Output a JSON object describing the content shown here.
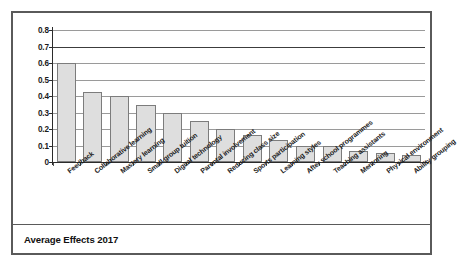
{
  "caption": "Average Effects 2017",
  "chart_data": {
    "type": "bar",
    "title": "Average Effects 2017",
    "xlabel": "",
    "ylabel": "",
    "ylim": [
      0,
      0.8
    ],
    "grid": true,
    "legend": "none",
    "orientation": "vertical",
    "bar_fill": "#dedede",
    "bar_border": "#7c7c7c",
    "yticks": [
      "0",
      "0.1",
      "0.2",
      "0.3",
      "0.4",
      "0.5",
      "0.6",
      "0.7",
      "0.8"
    ],
    "ytick_values": [
      0,
      0.1,
      0.2,
      0.3,
      0.4,
      0.5,
      0.6,
      0.7,
      0.8
    ],
    "categories": [
      "Feedback",
      "Collaborative learning",
      "Mastery learning",
      "Small group tuition",
      "Digital technology",
      "Parental involvement",
      "Reducing class size",
      "Sports participation",
      "Learning styles",
      "After school programmes",
      "Teaching assistants",
      "Mentoring",
      "Physical environment",
      "Ability grouping"
    ],
    "values": [
      0.6,
      0.425,
      0.4,
      0.345,
      0.3,
      0.25,
      0.2,
      0.165,
      0.135,
      0.1,
      0.1,
      0.065,
      0.055,
      0.045
    ]
  }
}
